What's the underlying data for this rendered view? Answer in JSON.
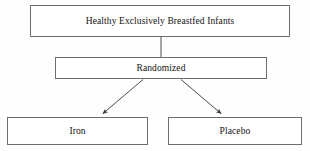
{
  "diagram": {
    "type": "flowchart",
    "canvas": {
      "width": 310,
      "height": 151,
      "background": "#fdfdfd"
    },
    "style": {
      "box_fill": "#ffffff",
      "box_border": "#6d6d6d",
      "connector_color": "#3a3a3a",
      "text_color": "#111111"
    },
    "nodes": [
      {
        "id": "population",
        "label": "Healthy Exclusively Breastfed Infants",
        "level": "enrollment"
      },
      {
        "id": "randomized",
        "label": "Randomized",
        "level": "allocation"
      },
      {
        "id": "iron",
        "label": "Iron",
        "level": "arm"
      },
      {
        "id": "placebo",
        "label": "Placebo",
        "level": "arm"
      }
    ],
    "edges": [
      {
        "id": "edge-population-randomized",
        "from": "population",
        "to": "randomized",
        "arrowhead": false
      },
      {
        "id": "edge-randomized-iron",
        "from": "randomized",
        "to": "iron",
        "arrowhead": true
      },
      {
        "id": "edge-randomized-placebo",
        "from": "randomized",
        "to": "placebo",
        "arrowhead": true
      }
    ]
  }
}
